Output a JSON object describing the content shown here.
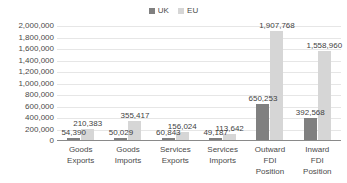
{
  "chart_data": {
    "type": "bar",
    "title": "",
    "subtitle": "",
    "xlabel": "",
    "ylabel": "",
    "ylim": [
      0,
      2000000
    ],
    "grid": true,
    "legend_position": "top-center",
    "categories": [
      "Goods Exports",
      "Goods Imports",
      "Services Exports",
      "Services Imports",
      "Outward FDI Position",
      "Inward FDI Position"
    ],
    "category_lines": [
      [
        "Goods",
        "Exports"
      ],
      [
        "Goods",
        "Imports"
      ],
      [
        "Services",
        "Exports"
      ],
      [
        "Services",
        "Imports"
      ],
      [
        "Outward",
        "FDI",
        "Position"
      ],
      [
        "Inward",
        "FDI",
        "Position"
      ]
    ],
    "series": [
      {
        "name": "UK",
        "color": "#808080",
        "values": [
          54390,
          50029,
          60843,
          49187,
          650253,
          392568
        ],
        "labels": [
          "54,390",
          "50,029",
          "60,843",
          "49,187",
          "650,253",
          "392,568"
        ]
      },
      {
        "name": "EU",
        "color": "#d6d6d6",
        "values": [
          210383,
          355417,
          156024,
          113642,
          1907768,
          1558960
        ],
        "labels": [
          "210,383",
          "355,417",
          "156,024",
          "113,642",
          "1,907,768",
          "1,558,960"
        ]
      }
    ],
    "yticks": [
      0,
      200000,
      400000,
      600000,
      800000,
      1000000,
      1200000,
      1400000,
      1600000,
      1800000,
      2000000
    ],
    "ytick_labels": [
      "0",
      "200,000",
      "400,000",
      "600,000",
      "800,000",
      "1,000,000",
      "1,200,000",
      "1,400,000",
      "1,600,000",
      "1,800,000",
      "2,000,000"
    ]
  },
  "legend": {
    "items": [
      {
        "label": "UK",
        "color": "#808080"
      },
      {
        "label": "EU",
        "color": "#d6d6d6"
      }
    ]
  },
  "colors": {
    "uk": "#808080",
    "eu": "#d6d6d6",
    "gridline": "#e6e6e6",
    "axis": "#8a8a8a",
    "text": "#4a4a4a",
    "background": "#ffffff"
  }
}
